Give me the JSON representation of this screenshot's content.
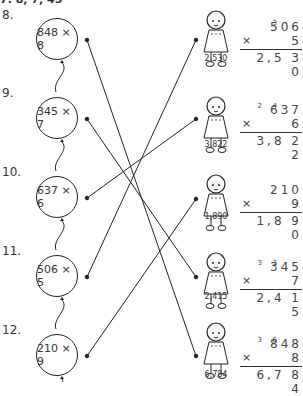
{
  "header_partial": "7.     8, 7, 45",
  "problems": [
    {
      "number": "8.",
      "expression": "848 × 8"
    },
    {
      "number": "9.",
      "expression": "345 × 7"
    },
    {
      "number": "10.",
      "expression": "637 × 6"
    },
    {
      "number": "11.",
      "expression": "506 × 5"
    },
    {
      "number": "12.",
      "expression": "210 × 9"
    }
  ],
  "figures": [
    {
      "answer_label": "2,530",
      "calc": {
        "carries": [
          {
            "digit": "3",
            "pos": 1
          }
        ],
        "top": "506",
        "multiplier": "5",
        "result": "2,5 3 0"
      }
    },
    {
      "answer_label": "3,822",
      "calc": {
        "carries": [
          {
            "digit": "2",
            "pos": 0
          },
          {
            "digit": "4",
            "pos": 1
          }
        ],
        "top": "637",
        "multiplier": "6",
        "result": "3,8 2 2"
      }
    },
    {
      "answer_label": "1,890",
      "calc": {
        "carries": [],
        "top": "210",
        "multiplier": "9",
        "result": "1,8 9 0"
      }
    },
    {
      "answer_label": "2,415",
      "calc": {
        "carries": [
          {
            "digit": "3",
            "pos": 0
          },
          {
            "digit": "3",
            "pos": 1
          }
        ],
        "top": "345",
        "multiplier": "7",
        "result": "2,4 1 5"
      }
    },
    {
      "answer_label": "6,784",
      "calc": {
        "carries": [
          {
            "digit": "3",
            "pos": 0
          },
          {
            "digit": "6",
            "pos": 1
          }
        ],
        "top": "848",
        "multiplier": "8",
        "result": "6,7 8 4"
      }
    }
  ],
  "matches": [
    {
      "from_problem": "848 × 8",
      "to_answer": "6,784"
    },
    {
      "from_problem": "345 × 7",
      "to_answer": "2,415"
    },
    {
      "from_problem": "637 × 6",
      "to_answer": "3,822"
    },
    {
      "from_problem": "506 × 5",
      "to_answer": "2,530"
    },
    {
      "from_problem": "210 × 9",
      "to_answer": "1,890"
    }
  ],
  "times_symbol": "×"
}
